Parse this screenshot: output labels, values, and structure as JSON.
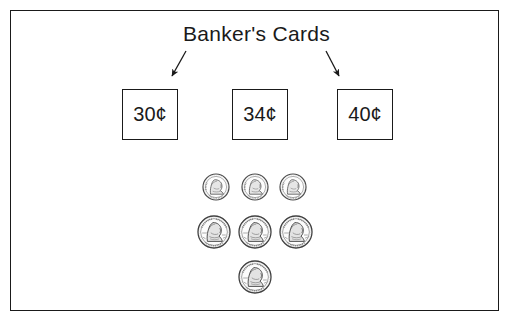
{
  "page": {
    "title": "Banker's Cards",
    "background_color": "#ffffff",
    "ink_color": "#1a1a1a",
    "width": 513,
    "height": 323
  },
  "frame": {
    "name": "worksheet-border"
  },
  "cards": [
    {
      "label": "30¢",
      "value": 30,
      "unit": "cents"
    },
    {
      "label": "34¢",
      "value": 34,
      "unit": "cents"
    },
    {
      "label": "40¢",
      "value": 40,
      "unit": "cents"
    }
  ],
  "arrows": [
    {
      "name": "arrow-to-first-card",
      "direction": "down-left",
      "from_label": "Banker's Cards",
      "to_label": "30¢"
    },
    {
      "name": "arrow-to-third-card",
      "direction": "down-right",
      "from_label": "Banker's Cards",
      "to_label": "40¢"
    }
  ],
  "coins": {
    "total_count": 7,
    "rows": [
      {
        "name": "dime-row",
        "coin_type": "dime",
        "coin_label": "10¢",
        "count": 3,
        "diameter_px": 26,
        "items": [
          {
            "cx": 216,
            "cy": 187
          },
          {
            "cx": 255,
            "cy": 187
          },
          {
            "cx": 293,
            "cy": 187
          }
        ]
      },
      {
        "name": "penny-row",
        "coin_type": "penny",
        "coin_label": "1¢",
        "count": 3,
        "diameter_px": 32,
        "items": [
          {
            "cx": 214,
            "cy": 232
          },
          {
            "cx": 255,
            "cy": 232
          },
          {
            "cx": 296,
            "cy": 232
          }
        ]
      },
      {
        "name": "penny-row-bottom",
        "coin_type": "penny",
        "coin_label": "1¢",
        "count": 1,
        "diameter_px": 32,
        "items": [
          {
            "cx": 255,
            "cy": 277
          }
        ]
      }
    ]
  }
}
